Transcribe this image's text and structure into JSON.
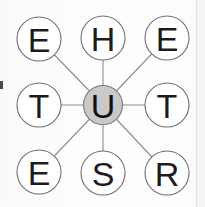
{
  "diagram": {
    "type": "radial-node-graph",
    "title": "",
    "center_node": {
      "id": "center",
      "label": "U",
      "cx": 103,
      "cy": 105,
      "r": 19.5,
      "fill": "#c9c9c9",
      "stroke": "#7a7a7a"
    },
    "outer_nodes": [
      {
        "id": "n-top-left",
        "label": "E",
        "cx": 39,
        "cy": 39,
        "r": 22,
        "position": "top-left"
      },
      {
        "id": "n-top-center",
        "label": "H",
        "cx": 103,
        "cy": 38,
        "r": 22,
        "position": "top-center"
      },
      {
        "id": "n-top-right",
        "label": "E",
        "cx": 167,
        "cy": 38,
        "r": 22,
        "position": "top-right"
      },
      {
        "id": "n-middle-left",
        "label": "T",
        "cx": 39,
        "cy": 105,
        "r": 22,
        "position": "middle-left"
      },
      {
        "id": "n-middle-right",
        "label": "T",
        "cx": 167,
        "cy": 105,
        "r": 22,
        "position": "middle-right"
      },
      {
        "id": "n-bottom-left",
        "label": "E",
        "cx": 39,
        "cy": 172,
        "r": 22,
        "position": "bottom-left"
      },
      {
        "id": "n-bottom-center",
        "label": "S",
        "cx": 103,
        "cy": 173,
        "r": 22,
        "position": "bottom-center"
      },
      {
        "id": "n-bottom-right",
        "label": "R",
        "cx": 167,
        "cy": 173,
        "r": 22,
        "position": "bottom-right"
      }
    ],
    "edges": [
      {
        "from": "center",
        "to": "n-top-left"
      },
      {
        "from": "center",
        "to": "n-top-center"
      },
      {
        "from": "center",
        "to": "n-top-right"
      },
      {
        "from": "center",
        "to": "n-middle-left"
      },
      {
        "from": "center",
        "to": "n-middle-right"
      },
      {
        "from": "center",
        "to": "n-bottom-left"
      },
      {
        "from": "center",
        "to": "n-bottom-center"
      },
      {
        "from": "center",
        "to": "n-bottom-right"
      }
    ],
    "letters_reading_order": [
      "E",
      "H",
      "E",
      "T",
      "U",
      "T",
      "E",
      "S",
      "R"
    ],
    "colors": {
      "background": "#fbfbfb",
      "node_fill": "#ffffff",
      "node_stroke": "#6e6e6e",
      "center_fill": "#c9c9c9",
      "edge_stroke": "#8c8c8c",
      "label_text": "#1c1c1c",
      "right_rule": "#e2e2e2"
    }
  },
  "labels": {
    "top_left": "E",
    "top_center": "H",
    "top_right": "E",
    "middle_left": "T",
    "center": "U",
    "middle_right": "T",
    "bottom_left": "E",
    "bottom_center": "S",
    "bottom_right": "R"
  }
}
